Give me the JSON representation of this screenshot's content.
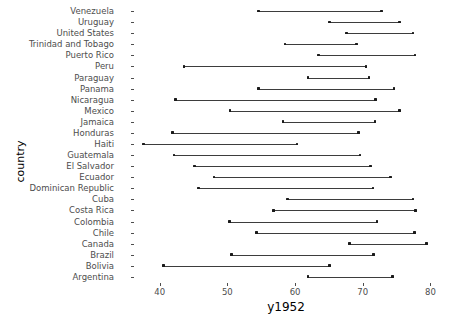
{
  "chart_data": {
    "type": "range-dot",
    "title": "",
    "subtitle": "",
    "xlabel": "y1952",
    "ylabel": "country",
    "xlim": [
      36.5,
      82
    ],
    "xticks": [
      40,
      50,
      60,
      70,
      80
    ],
    "xticklabels": [
      "40",
      "50",
      "60",
      "70",
      "80"
    ],
    "grid": false,
    "legend": null,
    "categories": [
      "Venezuela",
      "Uruguay",
      "United States",
      "Trinidad and Tobago",
      "Puerto Rico",
      "Peru",
      "Paraguay",
      "Panama",
      "Nicaragua",
      "Mexico",
      "Jamaica",
      "Honduras",
      "Haiti",
      "Guatemala",
      "El Salvador",
      "Ecuador",
      "Dominican Republic",
      "Cuba",
      "Costa Rica",
      "Colombia",
      "Chile",
      "Canada",
      "Brazil",
      "Bolivia",
      "Argentina"
    ],
    "series": [
      {
        "name": "start",
        "values": [
          54.6,
          65.1,
          67.6,
          58.5,
          63.5,
          43.6,
          61.9,
          54.6,
          42.3,
          50.4,
          58.2,
          41.9,
          37.6,
          42.1,
          45.1,
          48.0,
          45.7,
          58.9,
          56.8,
          50.3,
          54.3,
          68.0,
          50.6,
          40.6,
          61.9
        ]
      },
      {
        "name": "end",
        "values": [
          72.8,
          75.4,
          77.4,
          69.1,
          77.7,
          70.5,
          70.9,
          74.6,
          71.9,
          75.4,
          71.8,
          69.4,
          60.3,
          69.6,
          71.1,
          74.1,
          71.5,
          77.4,
          77.8,
          72.1,
          77.6,
          79.4,
          71.6,
          65.1,
          74.4
        ]
      }
    ],
    "ranges": [
      {
        "country": "Venezuela",
        "low": 54.6,
        "high": 72.8
      },
      {
        "country": "Uruguay",
        "low": 65.1,
        "high": 75.4
      },
      {
        "country": "United States",
        "low": 67.6,
        "high": 77.4
      },
      {
        "country": "Trinidad and Tobago",
        "low": 58.5,
        "high": 69.1
      },
      {
        "country": "Puerto Rico",
        "low": 63.5,
        "high": 77.7
      },
      {
        "country": "Peru",
        "low": 43.6,
        "high": 70.5
      },
      {
        "country": "Paraguay",
        "low": 61.9,
        "high": 70.9
      },
      {
        "country": "Panama",
        "low": 54.6,
        "high": 74.6
      },
      {
        "country": "Nicaragua",
        "low": 42.3,
        "high": 71.9
      },
      {
        "country": "Mexico",
        "low": 50.4,
        "high": 75.4
      },
      {
        "country": "Jamaica",
        "low": 58.2,
        "high": 71.8
      },
      {
        "country": "Honduras",
        "low": 41.9,
        "high": 69.4
      },
      {
        "country": "Haiti",
        "low": 37.6,
        "high": 60.3
      },
      {
        "country": "Guatemala",
        "low": 42.1,
        "high": 69.6
      },
      {
        "country": "El Salvador",
        "low": 45.1,
        "high": 71.1
      },
      {
        "country": "Ecuador",
        "low": 48.0,
        "high": 74.1
      },
      {
        "country": "Dominican Republic",
        "low": 45.7,
        "high": 71.5
      },
      {
        "country": "Cuba",
        "low": 58.9,
        "high": 77.4
      },
      {
        "country": "Costa Rica",
        "low": 56.8,
        "high": 77.8
      },
      {
        "country": "Colombia",
        "low": 50.3,
        "high": 72.1
      },
      {
        "country": "Chile",
        "low": 54.3,
        "high": 77.6
      },
      {
        "country": "Canada",
        "low": 68.0,
        "high": 79.4
      },
      {
        "country": "Brazil",
        "low": 50.6,
        "high": 71.6
      },
      {
        "country": "Bolivia",
        "low": 40.6,
        "high": 65.1
      },
      {
        "country": "Argentina",
        "low": 61.9,
        "high": 74.4
      }
    ],
    "colors": {
      "line": "#3d3d3d",
      "point": "#1a1a1a",
      "axis_text": "#4d4d4d",
      "axis_title": "#000000",
      "background": "#ffffff"
    }
  }
}
